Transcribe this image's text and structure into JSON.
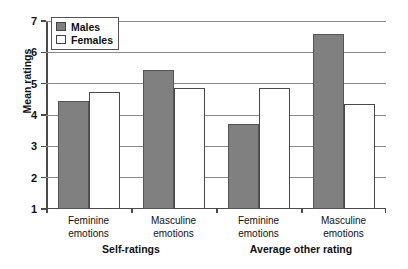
{
  "chart_data": {
    "type": "bar",
    "title": "",
    "xlabel": "",
    "ylabel": "Mean ratings",
    "ylim": [
      1,
      7
    ],
    "yticks": [
      1,
      2,
      3,
      4,
      5,
      6,
      7
    ],
    "ytick_labels": [
      "1",
      "2",
      "3",
      "4",
      "5",
      "6",
      "7"
    ],
    "grid": true,
    "legend_position": "top-left",
    "categories": [
      "Feminine emotions",
      "Masculine emotions",
      "Feminine emotions",
      "Masculine emotions"
    ],
    "category_lines": [
      [
        "Feminine",
        "emotions"
      ],
      [
        "Masculine",
        "emotions"
      ],
      [
        "Feminine",
        "emotions"
      ],
      [
        "Masculine",
        "emotions"
      ]
    ],
    "groups": [
      {
        "label": "Self-ratings",
        "categories": [
          0,
          1
        ]
      },
      {
        "label": "Average other rating",
        "categories": [
          2,
          3
        ]
      }
    ],
    "series": [
      {
        "name": "Males",
        "color": "#808080",
        "values": [
          4.45,
          5.45,
          3.7,
          6.6
        ]
      },
      {
        "name": "Females",
        "color": "#ffffff",
        "values": [
          4.75,
          4.85,
          4.85,
          4.35
        ]
      }
    ]
  },
  "legend": {
    "items": [
      {
        "label": "Males",
        "swatch": "males"
      },
      {
        "label": "Females",
        "swatch": "females"
      }
    ]
  },
  "axis": {
    "y_title": "Mean ratings"
  }
}
